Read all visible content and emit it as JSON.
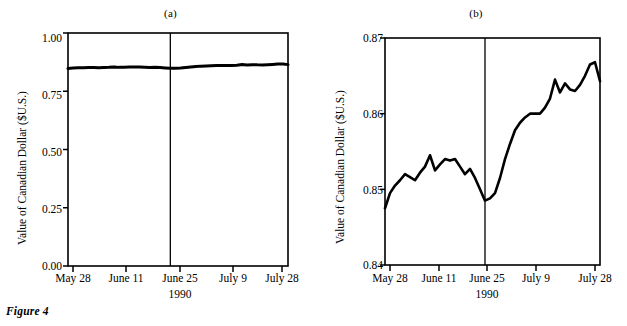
{
  "figure": {
    "caption": "Figure 4",
    "panels": [
      {
        "id": "a",
        "title": "(a)",
        "ylabel": "Value of Canadian Dollar ($U.S.)",
        "xlabel": "1990",
        "yticks": [
          "0.00",
          "0.25",
          "0.50",
          "0.75",
          "1.00"
        ],
        "xticks": [
          "May 28",
          "June 11",
          "June 25",
          "July 9",
          "July 28"
        ]
      },
      {
        "id": "b",
        "title": "(b)",
        "ylabel": "Value of Canadian Dollar ($U.S.)",
        "xlabel": "1990",
        "yticks": [
          "0.84",
          "0.85",
          "0.86",
          "0.87"
        ],
        "xticks": [
          "May 28",
          "June 11",
          "June 25",
          "July 9",
          "July 28"
        ]
      }
    ]
  },
  "chart_data": [
    {
      "type": "line",
      "panel": "(a)",
      "title": "(a)",
      "xlabel": "1990",
      "ylabel": "Value of Canadian Dollar ($U.S.)",
      "ylim": [
        0.0,
        1.0
      ],
      "yticks": [
        0.0,
        0.25,
        0.5,
        0.75,
        1.0
      ],
      "ytick_labels": [
        "0.00",
        "0.25",
        "0.50",
        "0.75",
        "1.00"
      ],
      "xtick_labels": [
        "May 28",
        "June 11",
        "June 25",
        "July 9",
        "July 28"
      ],
      "xtick_index": [
        0,
        10,
        20,
        30,
        43
      ],
      "grid": false,
      "legend": false,
      "annotations": [
        {
          "type": "vline",
          "x_index": 20,
          "label": "June 25"
        }
      ],
      "x": [
        0,
        1,
        2,
        3,
        4,
        5,
        6,
        7,
        8,
        9,
        10,
        11,
        12,
        13,
        14,
        15,
        16,
        17,
        18,
        19,
        20,
        21,
        22,
        23,
        24,
        25,
        26,
        27,
        28,
        29,
        30,
        31,
        32,
        33,
        34,
        35,
        36,
        37,
        38,
        39,
        40,
        41,
        42,
        43
      ],
      "values": [
        0.8475,
        0.8495,
        0.8505,
        0.8512,
        0.852,
        0.8516,
        0.8512,
        0.8522,
        0.853,
        0.8545,
        0.8525,
        0.8533,
        0.854,
        0.8538,
        0.854,
        0.853,
        0.852,
        0.8527,
        0.8515,
        0.85,
        0.8485,
        0.8488,
        0.8495,
        0.8515,
        0.854,
        0.856,
        0.8578,
        0.8588,
        0.8595,
        0.86,
        0.86,
        0.86,
        0.8608,
        0.862,
        0.8645,
        0.8628,
        0.864,
        0.8632,
        0.863,
        0.8638,
        0.865,
        0.8665,
        0.8668,
        0.8643
      ]
    },
    {
      "type": "line",
      "panel": "(b)",
      "title": "(b)",
      "xlabel": "1990",
      "ylabel": "Value of Canadian Dollar ($U.S.)",
      "ylim": [
        0.84,
        0.87
      ],
      "yticks": [
        0.84,
        0.85,
        0.86,
        0.87
      ],
      "ytick_labels": [
        "0.84",
        "0.85",
        "0.86",
        "0.87"
      ],
      "xtick_labels": [
        "May 28",
        "June 11",
        "June 25",
        "July 9",
        "July 28"
      ],
      "xtick_index": [
        0,
        10,
        20,
        30,
        43
      ],
      "grid": false,
      "legend": false,
      "annotations": [
        {
          "type": "vline",
          "x_index": 20,
          "label": "June 25"
        }
      ],
      "x": [
        0,
        1,
        2,
        3,
        4,
        5,
        6,
        7,
        8,
        9,
        10,
        11,
        12,
        13,
        14,
        15,
        16,
        17,
        18,
        19,
        20,
        21,
        22,
        23,
        24,
        25,
        26,
        27,
        28,
        29,
        30,
        31,
        32,
        33,
        34,
        35,
        36,
        37,
        38,
        39,
        40,
        41,
        42,
        43
      ],
      "values": [
        0.8475,
        0.8495,
        0.8505,
        0.8512,
        0.852,
        0.8516,
        0.8512,
        0.8522,
        0.853,
        0.8545,
        0.8525,
        0.8533,
        0.854,
        0.8538,
        0.854,
        0.853,
        0.852,
        0.8527,
        0.8515,
        0.85,
        0.8485,
        0.8488,
        0.8495,
        0.8515,
        0.854,
        0.856,
        0.8578,
        0.8588,
        0.8595,
        0.86,
        0.86,
        0.86,
        0.8608,
        0.862,
        0.8645,
        0.8628,
        0.864,
        0.8632,
        0.863,
        0.8638,
        0.865,
        0.8665,
        0.8668,
        0.8643
      ]
    }
  ]
}
